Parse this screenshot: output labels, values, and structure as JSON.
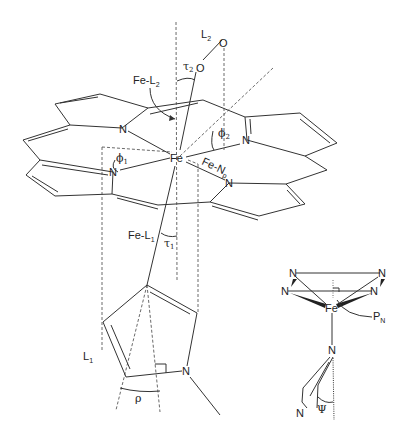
{
  "diagram": {
    "labels": {
      "L2": "L",
      "L2_sub": "2",
      "O_top": "O",
      "O_bottom": "O",
      "tau2": "τ",
      "tau2_sub": "2",
      "FeL2": "Fe-L",
      "FeL2_sub": "2",
      "phi2": "ϕ",
      "phi2_sub": "2",
      "phi1": "ϕ",
      "phi1_sub": "1",
      "Fe": "Fe",
      "FeNp": "Fe-N",
      "FeNp_sub": "p",
      "N": "N",
      "FeL1": "Fe-L",
      "FeL1_sub": "1",
      "tau1": "τ",
      "tau1_sub": "1",
      "L1": "L",
      "L1_sub": "1",
      "rho": "ρ",
      "inset_Fe": "Fe",
      "PN": "P",
      "PN_sub": "N",
      "psi": "Ψ"
    }
  }
}
